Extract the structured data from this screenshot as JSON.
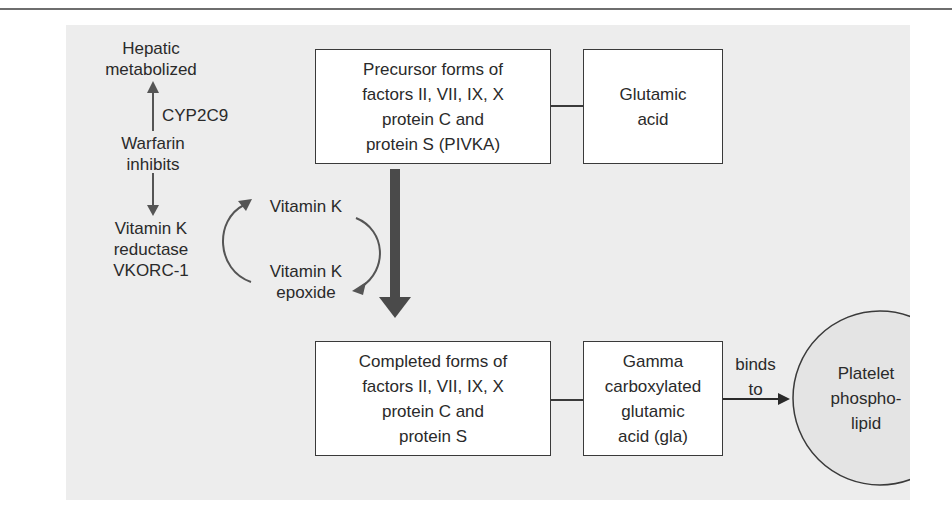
{
  "diagram": {
    "left_pathway": {
      "hepatic": "Hepatic\nmetabolized",
      "enzyme": "CYP2C9",
      "warfarin": "Warfarin\ninhibits",
      "reductase": "Vitamin K\nreductase\nVKORC-1"
    },
    "vitamin_cycle": {
      "vitamin_k": "Vitamin K",
      "vitamin_k_epoxide": "Vitamin K\nepoxide"
    },
    "boxes": {
      "precursor": "Precursor forms of\nfactors II, VII, IX, X\nprotein C and\nprotein S (PIVKA)",
      "glutamic_acid": "Glutamic\nacid",
      "completed": "Completed forms of\nfactors II, VII, IX, X\nprotein C and\nprotein S",
      "gla": "Gamma\ncarboxylated\nglutamic\nacid (gla)"
    },
    "binds_label": "binds\nto",
    "platelet": "Platelet\nphospho-\nlipid"
  },
  "colors": {
    "panel_background": "#ededed",
    "box_fill": "#ffffff",
    "line": "#3a3a3a",
    "main_arrow": "#4a4a4a"
  }
}
